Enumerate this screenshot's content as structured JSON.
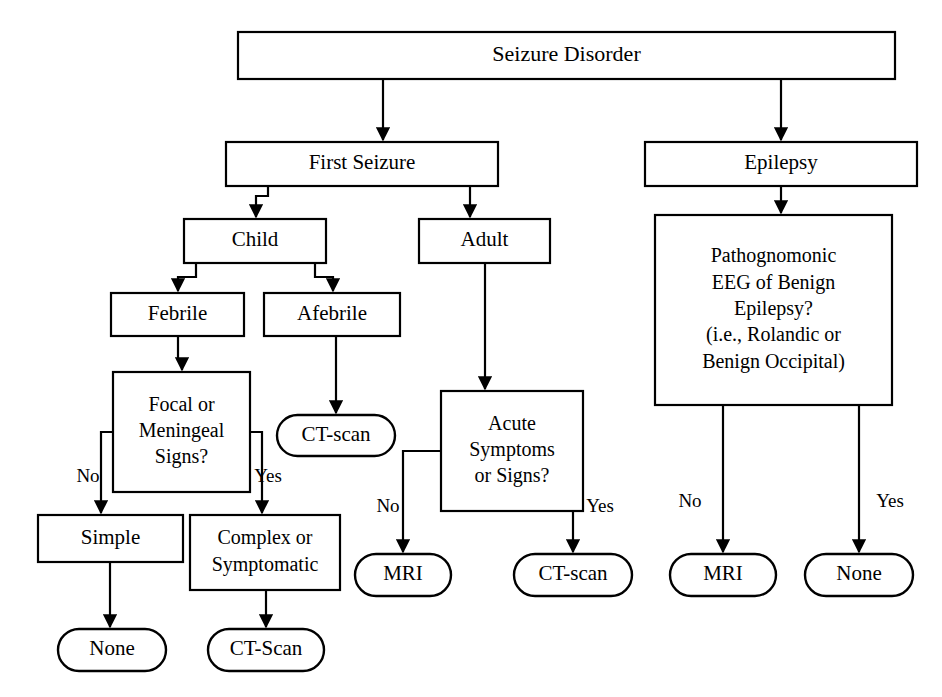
{
  "diagram": {
    "colors": {
      "background": "#ffffff",
      "stroke": "#000000",
      "fill": "#ffffff"
    },
    "nodes": [
      {
        "id": "seizure-disorder",
        "label": "Seizure Disorder",
        "shape": "rect",
        "x": 238,
        "y": 32,
        "w": 657,
        "h": 47,
        "font_size": 22,
        "lines": [
          "Seizure Disorder"
        ]
      },
      {
        "id": "first-seizure",
        "label": "First Seizure",
        "shape": "rect",
        "x": 226,
        "y": 142,
        "w": 272,
        "h": 44,
        "font_size": 21,
        "lines": [
          "First Seizure"
        ]
      },
      {
        "id": "epilepsy",
        "label": "Epilepsy",
        "shape": "rect",
        "x": 645,
        "y": 142,
        "w": 272,
        "h": 44,
        "font_size": 21,
        "lines": [
          "Epilepsy"
        ]
      },
      {
        "id": "child",
        "label": "Child",
        "shape": "rect",
        "x": 184,
        "y": 219,
        "w": 142,
        "h": 44,
        "font_size": 21,
        "lines": [
          "Child"
        ]
      },
      {
        "id": "adult",
        "label": "Adult",
        "shape": "rect",
        "x": 419,
        "y": 219,
        "w": 131,
        "h": 44,
        "font_size": 21,
        "lines": [
          "Adult"
        ]
      },
      {
        "id": "pathognomonic-eeg",
        "label": "Pathognomonic EEG of Benign Epilepsy? (i.e., Rolandic or Benign Occipital)",
        "shape": "rect",
        "x": 655,
        "y": 215,
        "w": 237,
        "h": 190,
        "font_size": 20,
        "lines": [
          "Pathognomonic",
          "EEG of Benign",
          "Epilepsy?",
          "(i.e., Rolandic or",
          "Benign Occipital)"
        ]
      },
      {
        "id": "febrile",
        "label": "Febrile",
        "shape": "rect",
        "x": 111,
        "y": 293,
        "w": 133,
        "h": 43,
        "font_size": 21,
        "lines": [
          "Febrile"
        ]
      },
      {
        "id": "afebrile",
        "label": "Afebrile",
        "shape": "rect",
        "x": 264,
        "y": 293,
        "w": 136,
        "h": 43,
        "font_size": 21,
        "lines": [
          "Afebrile"
        ]
      },
      {
        "id": "focal-meningeal-signs",
        "label": "Focal or Meningeal Signs?",
        "shape": "rect",
        "x": 113,
        "y": 372,
        "w": 137,
        "h": 120,
        "font_size": 20,
        "lines": [
          "Focal or",
          "Meningeal",
          "Signs?"
        ]
      },
      {
        "id": "ct-scan-afebrile",
        "label": "CT-scan",
        "shape": "round",
        "x": 277,
        "y": 415,
        "w": 118,
        "h": 41,
        "font_size": 21,
        "lines": [
          "CT-scan"
        ]
      },
      {
        "id": "acute-symptoms-signs",
        "label": "Acute Symptoms or Signs?",
        "shape": "rect",
        "x": 441,
        "y": 391,
        "w": 142,
        "h": 120,
        "font_size": 20,
        "lines": [
          "Acute",
          "Symptoms",
          "or Signs?"
        ]
      },
      {
        "id": "simple",
        "label": "Simple",
        "shape": "rect",
        "x": 38,
        "y": 515,
        "w": 145,
        "h": 47,
        "font_size": 21,
        "lines": [
          "Simple"
        ]
      },
      {
        "id": "complex-symptomatic",
        "label": "Complex or Symptomatic",
        "shape": "rect",
        "x": 190,
        "y": 515,
        "w": 150,
        "h": 75,
        "font_size": 20,
        "lines": [
          "Complex or",
          "Symptomatic"
        ]
      },
      {
        "id": "mri-adult",
        "label": "MRI",
        "shape": "round",
        "x": 355,
        "y": 554,
        "w": 96,
        "h": 42,
        "font_size": 21,
        "lines": [
          "MRI"
        ]
      },
      {
        "id": "ct-scan-adult",
        "label": "CT-scan",
        "shape": "round",
        "x": 514,
        "y": 554,
        "w": 118,
        "h": 42,
        "font_size": 21,
        "lines": [
          "CT-scan"
        ]
      },
      {
        "id": "mri-epilepsy",
        "label": "MRI",
        "shape": "round",
        "x": 670,
        "y": 554,
        "w": 106,
        "h": 42,
        "font_size": 21,
        "lines": [
          "MRI"
        ]
      },
      {
        "id": "none-epilepsy",
        "label": "None",
        "shape": "round",
        "x": 805,
        "y": 554,
        "w": 108,
        "h": 42,
        "font_size": 21,
        "lines": [
          "None"
        ]
      },
      {
        "id": "none-simple",
        "label": "None",
        "shape": "round",
        "x": 58,
        "y": 629,
        "w": 108,
        "h": 42,
        "font_size": 21,
        "lines": [
          "None"
        ]
      },
      {
        "id": "ct-scan-complex",
        "label": "CT-Scan",
        "shape": "round",
        "x": 208,
        "y": 629,
        "w": 116,
        "h": 42,
        "font_size": 21,
        "lines": [
          "CT-Scan"
        ]
      }
    ],
    "edge_labels": [
      {
        "id": "label-no-focal",
        "text": "No",
        "x": 88,
        "y": 478
      },
      {
        "id": "label-yes-focal",
        "text": "Yes",
        "x": 268,
        "y": 478
      },
      {
        "id": "label-no-acute",
        "text": "No",
        "x": 388,
        "y": 508
      },
      {
        "id": "label-yes-acute",
        "text": "Yes",
        "x": 600,
        "y": 508
      },
      {
        "id": "label-no-eeg",
        "text": "No",
        "x": 690,
        "y": 503
      },
      {
        "id": "label-yes-eeg",
        "text": "Yes",
        "x": 890,
        "y": 503
      }
    ],
    "connectors": [
      {
        "id": "edge-seizure-to-first",
        "path": "M 383 79 L 383 140",
        "arrow": true
      },
      {
        "id": "edge-seizure-to-epilepsy",
        "path": "M 781 79 L 781 140",
        "arrow": true
      },
      {
        "id": "edge-first-to-child",
        "path": "M 268 186 L 268 196 L 256 196 L 256 217",
        "arrow": true
      },
      {
        "id": "edge-first-to-adult",
        "path": "M 470 186 L 470 217",
        "arrow": true
      },
      {
        "id": "edge-epilepsy-to-eeg",
        "path": "M 781 186 L 781 213",
        "arrow": true
      },
      {
        "id": "edge-child-to-febrile",
        "path": "M 196 263 L 196 277 L 178 277 L 178 291",
        "arrow": true
      },
      {
        "id": "edge-child-to-afebrile",
        "path": "M 315 263 L 315 277 L 333 277 L 333 291",
        "arrow": true
      },
      {
        "id": "edge-febrile-to-focal",
        "path": "M 178 336 L 178 360 L 182 360 L 182 370",
        "arrow": true
      },
      {
        "id": "edge-afebrile-to-ct",
        "path": "M 336 336 L 336 413",
        "arrow": true
      },
      {
        "id": "edge-adult-to-acute",
        "path": "M 485 263 L 485 389",
        "arrow": true
      },
      {
        "id": "edge-focal-no",
        "path": "M 113 432 L 101 432 L 101 513",
        "arrow": true
      },
      {
        "id": "edge-focal-yes",
        "path": "M 250 432 L 262 432 L 262 513",
        "arrow": true
      },
      {
        "id": "edge-acute-no",
        "path": "M 441 451 L 403 451 L 403 552",
        "arrow": true
      },
      {
        "id": "edge-acute-yes",
        "path": "M 583 451 L 573 451 L 573 552",
        "arrow": true
      },
      {
        "id": "edge-eeg-no",
        "path": "M 723 405 L 723 552",
        "arrow": true
      },
      {
        "id": "edge-eeg-yes",
        "path": "M 859 405 L 859 552",
        "arrow": true
      },
      {
        "id": "edge-simple-to-none",
        "path": "M 110 562 L 110 627",
        "arrow": true
      },
      {
        "id": "edge-complex-to-ct",
        "path": "M 266 590 L 266 627",
        "arrow": true
      }
    ]
  }
}
